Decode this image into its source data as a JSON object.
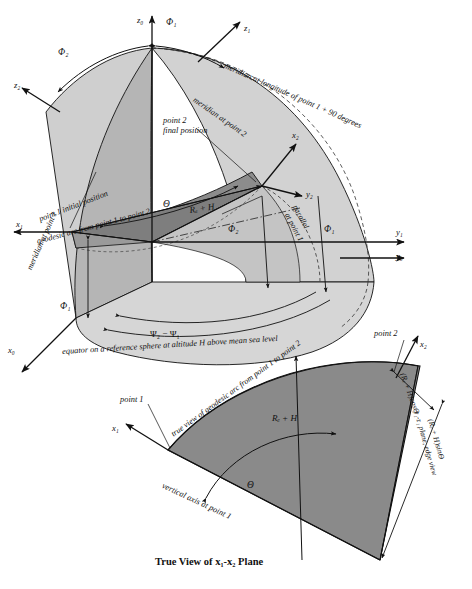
{
  "figure": {
    "title": "True View of  x₁-x₂ Plane",
    "caption_main": "",
    "colors": {
      "light_gray": "#d2d2d2",
      "mid_gray": "#b9b9b9",
      "dark_gray": "#8c8c8c",
      "darker_gray": "#7a7a7a",
      "line": "#111111",
      "background": "#ffffff"
    }
  },
  "upper_diagram": {
    "axes": [
      {
        "name": "z0-axis",
        "label": "z₀"
      },
      {
        "name": "z1-axis",
        "label": "z₁"
      },
      {
        "name": "z2-axis",
        "label": "z₂"
      },
      {
        "name": "x0-axis",
        "label": "x₀"
      },
      {
        "name": "x1-axis",
        "label": "x₁"
      },
      {
        "name": "x2-axis",
        "label": "x₂"
      },
      {
        "name": "y0-axis",
        "label": "y₀"
      },
      {
        "name": "y1-axis",
        "label": "y₁"
      },
      {
        "name": "y2-axis",
        "label": "y₂"
      }
    ],
    "angles": [
      {
        "name": "phi1-top",
        "label": "Φ₁"
      },
      {
        "name": "phi2-top",
        "label": "Φ₂"
      },
      {
        "name": "phi1-lower",
        "label": "Φ₁"
      },
      {
        "name": "phi2-lower",
        "label": "Φ₂"
      },
      {
        "name": "phi1-right",
        "label": "Φ₁"
      },
      {
        "name": "phi2-right",
        "label": "Φ₂"
      },
      {
        "name": "theta-arc",
        "label": "Θ"
      },
      {
        "name": "psi-difference",
        "label": "Ψ₂ − Ψ₁"
      }
    ],
    "annotations": [
      {
        "name": "meridian-longitude-point1-plus-90",
        "text": "meridian at longitude of point 1 + 90 degrees"
      },
      {
        "name": "meridian-at-point-2",
        "text": "meridian at point 2"
      },
      {
        "name": "meridian-at-point-1",
        "text": "meridian at point 1"
      },
      {
        "name": "point-2-final-position-line1",
        "text": "point 2"
      },
      {
        "name": "point-2-final-position-line2",
        "text": "final position"
      },
      {
        "name": "point-1-initial-position",
        "text": "point 1 initial position"
      },
      {
        "name": "geodesic-arc-label",
        "text": "geodesic arc from point 1 to point 2"
      },
      {
        "name": "parallel-at-point-1-line1",
        "text": "parallel"
      },
      {
        "name": "parallel-at-point-1-line2",
        "text": "at point 1"
      },
      {
        "name": "radius-plus-altitude",
        "text": "Rₑ + H"
      },
      {
        "name": "equator-reference-sphere",
        "text": "equator on a reference sphere at altitude H above mean sea level"
      }
    ]
  },
  "lower_diagram": {
    "axes": [
      {
        "name": "x1-axis-lower",
        "label": "x₁"
      },
      {
        "name": "x2-axis-lower",
        "label": "x₂"
      }
    ],
    "annotations": [
      {
        "name": "true-view-geodesic-arc",
        "text": "true view of geodesic arc from point 1 to point 2"
      },
      {
        "name": "point-1-label-lower",
        "text": "point 1"
      },
      {
        "name": "point-2-label-lower",
        "text": "point 2"
      },
      {
        "name": "radius-plus-altitude-lower",
        "text": "Rₑ + H"
      },
      {
        "name": "theta-angle-lower",
        "text": "Θ"
      },
      {
        "name": "vertical-axis-at-point-1",
        "text": "vertical axis at point 1"
      },
      {
        "name": "y1-z1-plane-edge-view",
        "text": "y₁-z₁ plane, edge view"
      },
      {
        "name": "projection-cos",
        "text": "(Rₑ + H)cosΘ"
      },
      {
        "name": "projection-sin",
        "text": "(Rₑ + H)sinΘ"
      }
    ]
  }
}
